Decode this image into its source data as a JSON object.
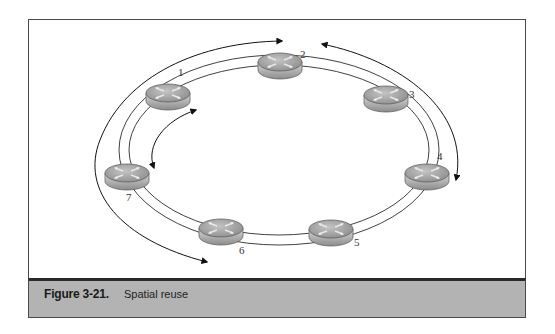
{
  "figure": {
    "label": "Figure 3-21.",
    "caption": "Spatial reuse"
  },
  "diagram": {
    "type": "ring-topology",
    "nodes": [
      {
        "id": "1",
        "label": "1",
        "x": 168,
        "y": 93,
        "lx": 180,
        "ly": 76
      },
      {
        "id": "2",
        "label": "2",
        "x": 280,
        "y": 62,
        "lx": 302,
        "ly": 56
      },
      {
        "id": "3",
        "label": "3",
        "x": 386,
        "y": 95,
        "lx": 411,
        "ly": 97
      },
      {
        "id": "4",
        "label": "4",
        "x": 427,
        "y": 173,
        "lx": 438,
        "ly": 159
      },
      {
        "id": "5",
        "label": "5",
        "x": 331,
        "y": 229,
        "lx": 355,
        "ly": 245
      },
      {
        "id": "6",
        "label": "6",
        "x": 221,
        "y": 228,
        "lx": 240,
        "ly": 253
      },
      {
        "id": "7",
        "label": "7",
        "x": 127,
        "y": 173,
        "lx": 127,
        "ly": 200
      }
    ],
    "flows": [
      {
        "name": "outer-left-flow",
        "from": "6",
        "to": "2",
        "direction": "7→1→2 path, arrow at node 2 and node 6 side"
      },
      {
        "name": "outer-right-flow",
        "from": "2",
        "to": "4",
        "direction": "arrow at node 2 and node 4"
      },
      {
        "name": "inner-left-flow",
        "from": "1",
        "to": "7",
        "direction": "bidirectional"
      }
    ],
    "colors": {
      "ring_line": "#2b2b2b",
      "router_top": "#9a9a9a",
      "router_side": "#c8c8c8",
      "caption_bg": "#b3b3b3"
    }
  }
}
